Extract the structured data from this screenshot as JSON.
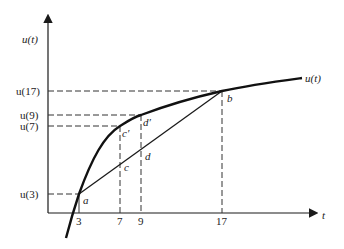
{
  "diagram": {
    "axes": {
      "x_label": "t",
      "y_label": "u(t)"
    },
    "curve_label": "u(t)",
    "y_ticks": [
      {
        "label": "u(17)",
        "t": 17
      },
      {
        "label": "u(9)",
        "t": 9
      },
      {
        "label": "u(7)",
        "t": 7
      },
      {
        "label": "u(3)",
        "t": 3
      }
    ],
    "x_ticks": [
      "3",
      "7",
      "9",
      "17"
    ],
    "points": {
      "a": "a",
      "b": "b",
      "c": "c",
      "c_prime": "c′",
      "d": "d",
      "d_prime": "d′"
    },
    "colors": {
      "ink": "#1a1a1a",
      "dash": "#333333",
      "background": "#ffffff"
    }
  }
}
